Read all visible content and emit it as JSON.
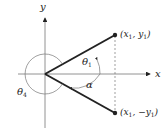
{
  "figure": {
    "type": "coordinate-angle-diagram",
    "axes": {
      "x_label": "x",
      "y_label": "y"
    },
    "points": [
      {
        "id": "p1",
        "label_pre": "(x",
        "sub1": "1",
        "mid": ", y",
        "sub2": "1",
        "post": ")"
      },
      {
        "id": "p2",
        "label_pre": "(x",
        "sub1": "1",
        "mid": ", −y",
        "sub2": "1",
        "post": ")"
      }
    ],
    "angles": [
      {
        "id": "theta1",
        "symbol": "θ",
        "sub": "1"
      },
      {
        "id": "alpha",
        "symbol": "α"
      },
      {
        "id": "theta4",
        "symbol": "θ",
        "sub": "4"
      }
    ],
    "colors": {
      "ink": "#222222",
      "thin": "#777777",
      "bg": "#ffffff"
    }
  }
}
